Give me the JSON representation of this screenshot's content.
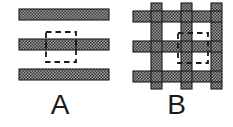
{
  "figure": {
    "title": "",
    "background_color": "#ffffff",
    "fill_color": "#8c8c8c",
    "outline_color": "#1a1a1a",
    "dash_color": "#1a1a1a",
    "hatch_pattern": "checkerboard-dots"
  },
  "panels": [
    {
      "id": "a",
      "label": "A",
      "description": "Three parallel horizontal hatched bars with a dashed unit-cell rectangle over the middle bar",
      "geometry": {
        "bar_left": 19,
        "bar_right": 109,
        "bar_width": 90,
        "bar_height": 11,
        "bars_y": [
          9,
          39,
          69
        ],
        "bar_count": 3,
        "dashed_cell": {
          "x": 46,
          "y": 32,
          "width": 30,
          "height": 30
        },
        "tick_x": [
          46,
          76
        ]
      }
    },
    {
      "id": "b",
      "label": "B",
      "description": "Woven square lattice of crossing hatched bars with a dashed unit-cell rectangle at the central crossing",
      "geometry": {
        "grid_left": 13,
        "grid_top": 3,
        "grid_size": 86,
        "bar_thickness": 11,
        "vertical_bars_x": [
          18,
          48,
          78
        ],
        "horizontal_bars_y": [
          8,
          38,
          68
        ],
        "line_count": 3,
        "dashed_cell": {
          "x": 45,
          "y": 30,
          "width": 30,
          "height": 30
        }
      }
    }
  ],
  "labels": {
    "panel_a": "A",
    "panel_b": "B"
  }
}
